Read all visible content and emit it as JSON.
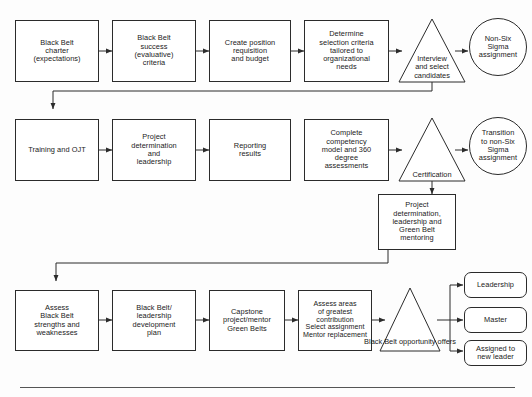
{
  "diagram": {
    "line_color": "#2b2b2b",
    "background": "#fdfdfd",
    "rows": {
      "row1": {
        "nodes": [
          {
            "id": "bb-charter",
            "shape": "rect",
            "text": "Black Belt\ncharter\n(expectations)"
          },
          {
            "id": "bb-success",
            "shape": "rect",
            "text": "Black Belt\nsuccess\n(evaluative)\ncriteria"
          },
          {
            "id": "create-position",
            "shape": "rect",
            "text": "Create position\nrequisition\nand budget"
          },
          {
            "id": "determine-criteria",
            "shape": "rect",
            "text": "Determine\nselection criteria\ntailored to\norganizational\nneeds"
          },
          {
            "id": "interview-select",
            "shape": "triangle",
            "text": "Interview\nand select\ncandidates"
          },
          {
            "id": "non-six-sigma",
            "shape": "circle",
            "text": "Non-Six\nSigma\nassignment"
          }
        ]
      },
      "row2": {
        "nodes": [
          {
            "id": "training-ojt",
            "shape": "rect",
            "text": "Training and OJT"
          },
          {
            "id": "project-determination",
            "shape": "rect",
            "text": "Project\ndetermination\nand\nleadership"
          },
          {
            "id": "reporting-results",
            "shape": "rect",
            "text": "Reporting\nresults"
          },
          {
            "id": "complete-competency",
            "shape": "rect",
            "text": "Complete\ncompetency\nmodel and 360\ndegree\nassessments"
          },
          {
            "id": "certification",
            "shape": "triangle",
            "text": "Certification"
          },
          {
            "id": "transition-non-six-sigma",
            "shape": "circle",
            "text": "Transition\nto non-Six\nSigma\nassignment"
          }
        ]
      },
      "middle": {
        "nodes": [
          {
            "id": "project-det-green-belt",
            "shape": "rect",
            "text": "Project\ndetermination,\nleadership and\nGreen Belt\nmentoring"
          }
        ]
      },
      "row3": {
        "nodes": [
          {
            "id": "assess-strengths",
            "shape": "rect",
            "text": "Assess\nBlack Belt\nstrengths and\nweaknesses"
          },
          {
            "id": "development-plan",
            "shape": "rect",
            "text": "Black Belt/\nleadership\ndevelopment\nplan"
          },
          {
            "id": "capstone-project",
            "shape": "rect",
            "text": "Capstone\nproject/mentor\nGreen Belts"
          },
          {
            "id": "assess-contribution",
            "shape": "rect",
            "text": "Assess areas\nof greatest\ncontribution\nSelect assignment\nMentor replacement"
          },
          {
            "id": "bb-opportunity",
            "shape": "triangle",
            "text": "Black Belt\nopportunity\noffers"
          }
        ]
      },
      "outcomes": {
        "nodes": [
          {
            "id": "leadership",
            "shape": "rounded-rect",
            "text": "Leadership"
          },
          {
            "id": "master",
            "shape": "rounded-rect",
            "text": "Master"
          },
          {
            "id": "assigned-new-leader",
            "shape": "rounded-rect",
            "text": "Assigned to\nnew leader"
          }
        ]
      }
    }
  }
}
